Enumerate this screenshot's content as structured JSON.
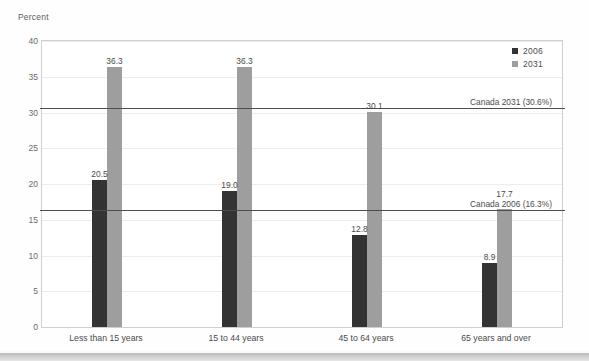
{
  "chart_data": {
    "type": "bar",
    "title": "",
    "subtitle": "",
    "xlabel": "",
    "ylabel": "Percent",
    "ylim": [
      0,
      40
    ],
    "yticks": [
      0,
      5,
      10,
      15,
      20,
      25,
      30,
      35,
      40
    ],
    "ytick_labels": [
      "0",
      "5",
      "10",
      "15",
      "20",
      "25",
      "30",
      "35",
      "40"
    ],
    "grid": true,
    "legend_position": "top-right",
    "categories": [
      "Less than 15 years",
      "15 to 44 years",
      "45 to 64 years",
      "65 years and over"
    ],
    "series": [
      {
        "name": "2006",
        "color": "#333333",
        "values": [
          20.5,
          19.0,
          12.8,
          8.9
        ],
        "value_labels": [
          "20.5",
          "19.0",
          "12.8",
          "8.9"
        ]
      },
      {
        "name": "2031",
        "color": "#9e9e9e",
        "values": [
          36.3,
          36.3,
          30.1,
          17.7
        ],
        "value_labels": [
          "36.3",
          "36.3",
          "30.1",
          "17.7"
        ]
      }
    ],
    "reference_lines": [
      {
        "label": "Canada 2031 (30.6%)",
        "value": 30.6,
        "color": "#4d4d4d"
      },
      {
        "label": "Canada 2006 (16.3%)",
        "value": 16.3,
        "color": "#4d4d4d"
      }
    ]
  },
  "legend": {
    "items": [
      {
        "label": "2006",
        "color": "#333333"
      },
      {
        "label": "2031",
        "color": "#9e9e9e"
      }
    ]
  },
  "axis": {
    "y_title": "Percent"
  }
}
